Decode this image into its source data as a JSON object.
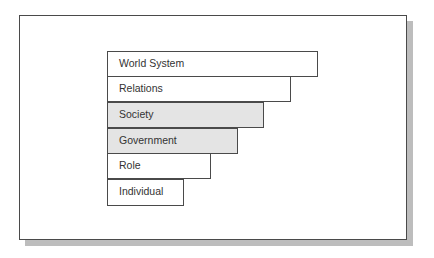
{
  "diagram": {
    "type": "stepped-hierarchy",
    "levels": [
      {
        "label": "World System",
        "shaded": false
      },
      {
        "label": "Relations",
        "shaded": false
      },
      {
        "label": "Society",
        "shaded": true
      },
      {
        "label": "Government",
        "shaded": true
      },
      {
        "label": "Role",
        "shaded": false
      },
      {
        "label": "Individual",
        "shaded": false
      }
    ]
  },
  "colors": {
    "border": "#4a4a4a",
    "shaded_fill": "#e4e4e4",
    "plain_fill": "#ffffff",
    "shadow": "#bdbdbd",
    "text": "#333333"
  }
}
